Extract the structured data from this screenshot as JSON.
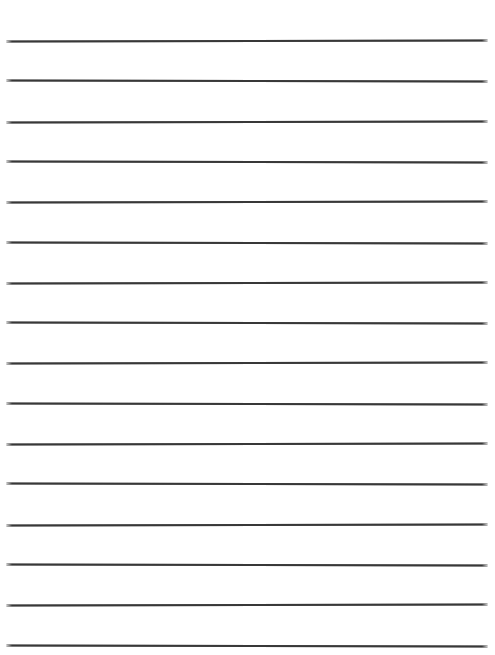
{
  "document": {
    "kind": "blank-ruled-notebook-page",
    "background_color": "#ffffff",
    "text_content": ""
  },
  "ruling": {
    "line_count": 16,
    "first_line_y": 40,
    "line_spacing": 40.3,
    "line_left_x": 6,
    "line_right_x": 488,
    "line_thickness": 2,
    "line_color": "#383838",
    "tilt_variation_deg": 0.12
  }
}
